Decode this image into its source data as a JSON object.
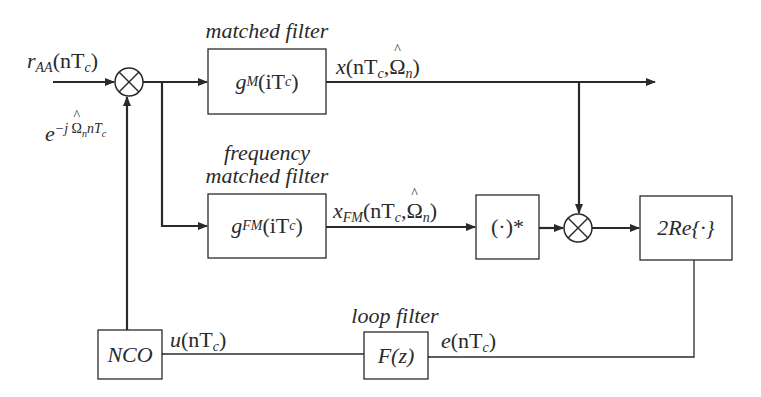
{
  "diagram": {
    "type": "block-diagram",
    "nodes": {
      "input_signal": {
        "base": "r",
        "sub": "AA",
        "arg": "(nT",
        "arg_sub": "c",
        "close": ")"
      },
      "mixer1": {
        "symbol": "⊗"
      },
      "mixer1_feedback_label": {
        "base": "e",
        "sup": "−j",
        "omega": "Ω",
        "omega_sub": "n",
        "tail": "nT",
        "tail_sub": "c"
      },
      "matched_filter": {
        "caption": "matched filter",
        "func": "g",
        "func_sub": "M",
        "arg": "(iT",
        "arg_sub": "c",
        "close": ")"
      },
      "mf_output": {
        "base": "x",
        "arg": "(nT",
        "arg_sub": "c",
        "comma": ",",
        "omega": "Ω",
        "omega_sub": "n",
        "close": ")"
      },
      "frequency_matched_filter": {
        "caption_line1": "frequency",
        "caption_line2": "matched filter",
        "func": "g",
        "func_sub": "FM",
        "arg": "(iT",
        "arg_sub": "c",
        "close": ")"
      },
      "fmf_output": {
        "base": "x",
        "sub": "FM",
        "arg": "(nT",
        "arg_sub": "c",
        "comma": ",",
        "omega": "Ω",
        "omega_sub": "n",
        "close": ")"
      },
      "conjugate": {
        "label": "(·)*"
      },
      "mixer2": {
        "symbol": "⊗"
      },
      "real_part": {
        "label": "2Re{·}"
      },
      "error_signal": {
        "base": "e",
        "arg": "(nT",
        "arg_sub": "c",
        "close": ")"
      },
      "loop_filter": {
        "caption": "loop filter",
        "label": "F(z)"
      },
      "control_signal": {
        "base": "u",
        "arg": "(nT",
        "arg_sub": "c",
        "close": ")"
      },
      "nco": {
        "label": "NCO"
      }
    },
    "edges": [
      {
        "from": "input_signal",
        "to": "mixer1"
      },
      {
        "from": "nco",
        "to": "mixer1"
      },
      {
        "from": "mixer1",
        "to": "matched_filter"
      },
      {
        "from": "mixer1",
        "to": "frequency_matched_filter"
      },
      {
        "from": "matched_filter",
        "to": "output",
        "label": "x(nTc, Ω̂n)"
      },
      {
        "from": "matched_filter",
        "to": "mixer2"
      },
      {
        "from": "frequency_matched_filter",
        "to": "conjugate",
        "label": "xFM(nTc, Ω̂n)"
      },
      {
        "from": "conjugate",
        "to": "mixer2"
      },
      {
        "from": "mixer2",
        "to": "real_part"
      },
      {
        "from": "real_part",
        "to": "loop_filter",
        "label": "e(nTc)"
      },
      {
        "from": "loop_filter",
        "to": "nco",
        "label": "u(nTc)"
      }
    ],
    "colors": {
      "line": "#2a2a2a",
      "background": "#ffffff"
    }
  }
}
